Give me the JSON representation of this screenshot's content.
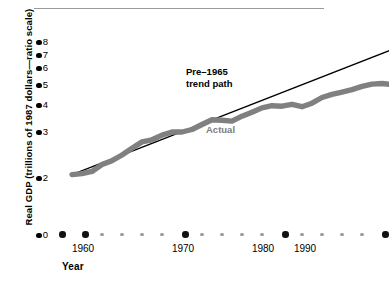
{
  "chart_data": {
    "type": "line",
    "title": "",
    "xlabel": "Year",
    "ylabel": "Real GDP (trillions of 1987 dollars—ratio scale)",
    "yscale": "ratio (log)",
    "ytick_labels": [
      "8",
      "7",
      "6",
      "5",
      "4",
      "3",
      "2",
      "0"
    ],
    "ytick_values": [
      8,
      7,
      6,
      5,
      4,
      3,
      2,
      0
    ],
    "xtick_labels": [
      "1960",
      "1970",
      "1980",
      "1990"
    ],
    "xtick_values": [
      1960,
      1970,
      1980,
      1990
    ],
    "grid": false,
    "legend_position": "inline-annotations",
    "annotations": [
      {
        "name": "trend-label",
        "text": "Pre–1965\ntrend path",
        "color": "#000000"
      },
      {
        "name": "actual-label",
        "text": "Actual",
        "color": "#7d7d7d"
      }
    ],
    "series": [
      {
        "name": "Actual",
        "color": "#808080",
        "x": [
          1959,
          1960,
          1961,
          1962,
          1963,
          1964,
          1965,
          1966,
          1967,
          1968,
          1969,
          1970,
          1971,
          1972,
          1973,
          1974,
          1975,
          1976,
          1977,
          1978,
          1979,
          1980,
          1981,
          1982,
          1983,
          1984,
          1985,
          1986,
          1987,
          1988,
          1989,
          1990,
          1991
        ],
        "values": [
          2.06,
          2.08,
          2.12,
          2.25,
          2.33,
          2.45,
          2.6,
          2.75,
          2.8,
          2.92,
          3.0,
          3.0,
          3.08,
          3.25,
          3.42,
          3.4,
          3.37,
          3.55,
          3.7,
          3.88,
          3.97,
          3.95,
          4.03,
          3.93,
          4.08,
          4.35,
          4.5,
          4.62,
          4.75,
          4.92,
          5.05,
          5.08,
          5.02
        ]
      },
      {
        "name": "Pre-1965 trend path",
        "color": "#000000",
        "x": [
          1959,
          1991
        ],
        "values": [
          2.06,
          7.4
        ]
      }
    ]
  },
  "axes": {
    "y_axis_name": "real-gdp-axis",
    "x_axis_name": "year-axis"
  }
}
